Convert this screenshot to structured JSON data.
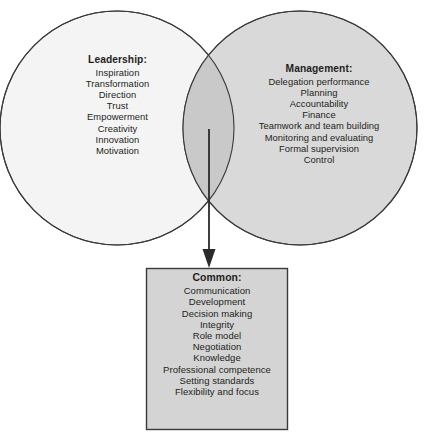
{
  "diagram": {
    "type": "venn",
    "title": "",
    "colors": {
      "leadership_fill": "#f4f4f4",
      "management_fill": "#d8d8d8",
      "overlap_fill": "#cccccc",
      "common_box_fill": "#d4d4d4",
      "stroke": "#3a3a3a",
      "text": "#231f20"
    },
    "leadership": {
      "title": "Leadership:",
      "items": [
        "Inspiration",
        "Transformation",
        "Direction",
        "Trust",
        "Empowerment",
        "Creativity",
        "Innovation",
        "Motivation"
      ]
    },
    "management": {
      "title": "Management:",
      "items": [
        "Delegation performance",
        "Planning",
        "Accountability",
        "Finance",
        "Teamwork and team building",
        "Monitoring and evaluating",
        "Formal supervision",
        "Control"
      ]
    },
    "common": {
      "title": "Common:",
      "items": [
        "Communication",
        "Development",
        "Decision making",
        "Integrity",
        "Role model",
        "Negotiation",
        "Knowledge",
        "Professional competence",
        "Setting standards",
        "Flexibility and focus"
      ]
    },
    "connector": {
      "name": "down-arrow-icon",
      "from": "overlap",
      "to": "common"
    }
  }
}
